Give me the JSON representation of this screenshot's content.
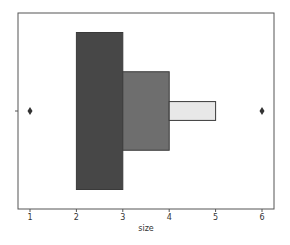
{
  "chart_data": {
    "type": "boxen",
    "title": "",
    "xlabel": "size",
    "ylabel": "",
    "xlim": [
      0.75,
      6.25
    ],
    "xticks": [
      1,
      2,
      3,
      4,
      5,
      6
    ],
    "xtick_labels": [
      "1",
      "2",
      "3",
      "4",
      "5",
      "6"
    ],
    "grid": false,
    "orientation": "horizontal",
    "letter_value_boxes": [
      {
        "level": 1,
        "low": 2,
        "high": 3,
        "height_frac": 1.0,
        "color": "#474747"
      },
      {
        "level": 2,
        "low": 3,
        "high": 4,
        "height_frac": 0.5,
        "color": "#6e6e6e"
      },
      {
        "level": 3,
        "low": 4,
        "high": 5,
        "height_frac": 0.12,
        "color": "#e8e8e8"
      }
    ],
    "outliers": [
      1,
      6
    ],
    "median": 2
  },
  "colors": {
    "edge": "#3a3a3a",
    "frame": "#555555",
    "outlier": "#333333"
  }
}
